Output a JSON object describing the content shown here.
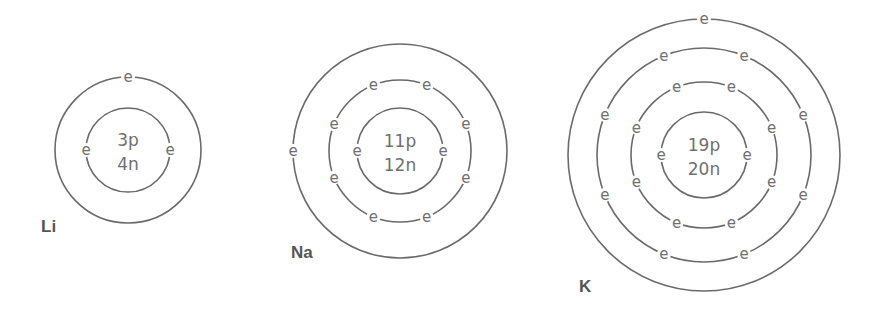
{
  "diagram": {
    "type": "bohr-models",
    "colors": {
      "line": "#6a6a6a",
      "text": "#707070",
      "label": "#555555",
      "background": "#ffffff"
    },
    "atoms": [
      {
        "symbol": "Li",
        "protons_label": "3p",
        "neutrons_label": "4n",
        "electron_symbol": "e",
        "shell_electrons": [
          2,
          1
        ],
        "center": [
          128,
          150
        ],
        "shell_radii": [
          42,
          73
        ],
        "label_pos": [
          41,
          232
        ]
      },
      {
        "symbol": "Na",
        "protons_label": "11p",
        "neutrons_label": "12n",
        "electron_symbol": "e",
        "shell_electrons": [
          2,
          8,
          1
        ],
        "center": [
          400,
          151
        ],
        "shell_radii": [
          43,
          71,
          107
        ],
        "label_pos": [
          291,
          258
        ]
      },
      {
        "symbol": "K",
        "protons_label": "19p",
        "neutrons_label": "20n",
        "electron_symbol": "e",
        "shell_electrons": [
          2,
          8,
          8,
          1
        ],
        "center": [
          704,
          155
        ],
        "shell_radii": [
          43,
          73,
          107,
          136
        ],
        "label_pos": [
          579,
          292
        ]
      }
    ]
  }
}
